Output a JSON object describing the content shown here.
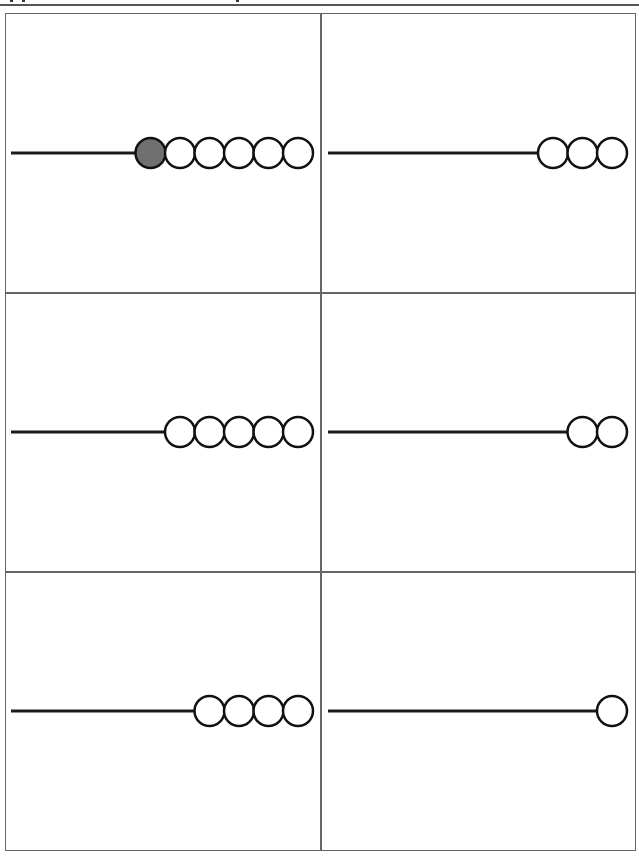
{
  "worksheet": {
    "layout": {
      "rows": 3,
      "cols": 2
    },
    "cells": [
      {
        "id": 1,
        "bead_count": 6,
        "filled_beads": 1
      },
      {
        "id": 2,
        "bead_count": 3,
        "filled_beads": 0
      },
      {
        "id": 3,
        "bead_count": 5,
        "filled_beads": 0
      },
      {
        "id": 4,
        "bead_count": 2,
        "filled_beads": 0
      },
      {
        "id": 5,
        "bead_count": 4,
        "filled_beads": 0
      },
      {
        "id": 6,
        "bead_count": 1,
        "filled_beads": 0
      }
    ],
    "colors": {
      "border": "#666666",
      "string": "#1a1a1a",
      "bead_outline": "#111111",
      "bead_empty": "#ffffff",
      "bead_filled": "#707070"
    }
  }
}
